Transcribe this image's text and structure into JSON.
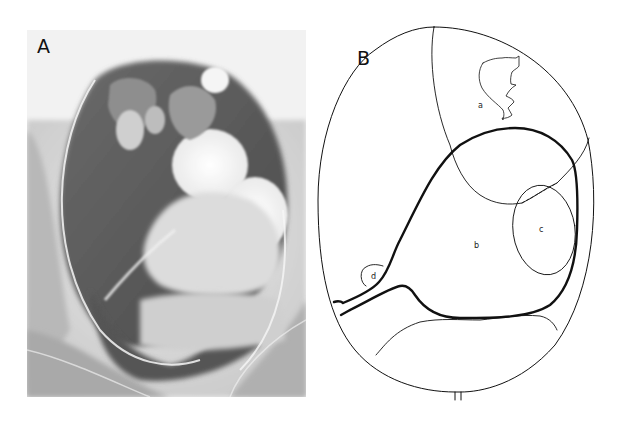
{
  "figure": {
    "panels": [
      {
        "id": "A",
        "label": "A",
        "type": "radiograph",
        "description": "Grayscale X-ray image of a large oval distended structure with lobulated bright contrast-filled masses"
      },
      {
        "id": "B",
        "label": "B",
        "type": "line-drawing",
        "regions": [
          {
            "id": "a",
            "label": "a"
          },
          {
            "id": "b",
            "label": "b"
          },
          {
            "id": "c",
            "label": "c"
          },
          {
            "id": "d",
            "label": "d"
          }
        ]
      }
    ],
    "colors": {
      "background": "#ffffff",
      "line": "#111111",
      "xray_dark": "#4a4a4a",
      "xray_light": "#f4f4f4"
    }
  }
}
